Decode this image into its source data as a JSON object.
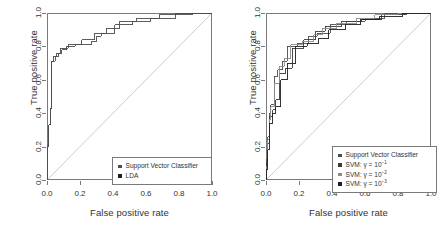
{
  "figure": {
    "background": "#ffffff",
    "axis_color": "#7a7a7a",
    "text_color": "#333333",
    "diagonal_color": "#cccccc"
  },
  "axes": {
    "xlabel": "False positive rate",
    "ylabel": "True positive rate",
    "xticks": [
      "0.0",
      "0.2",
      "0.4",
      "0.6",
      "0.8",
      "1.0"
    ],
    "yticks": [
      "0.0",
      "0.2",
      "0.4",
      "0.6",
      "0.8",
      "1.0"
    ],
    "xlim": [
      0,
      1
    ],
    "ylim": [
      0,
      1
    ]
  },
  "chart_data": [
    {
      "type": "line",
      "panel": "left",
      "title": "",
      "xlabel": "False positive rate",
      "ylabel": "True positive rate",
      "xlim": [
        0,
        1
      ],
      "ylim": [
        0,
        1
      ],
      "grid": false,
      "legend_position": "bottom-right",
      "reference_line": {
        "name": "chance-diagonal",
        "from": [
          0,
          0
        ],
        "to": [
          1,
          1
        ],
        "color": "#cccccc"
      },
      "series": [
        {
          "name": "Support Vector Classifier",
          "color": "#4d4d4d",
          "marker": "square",
          "points": [
            [
              0.0,
              0.0
            ],
            [
              0.0,
              0.2
            ],
            [
              0.01,
              0.2
            ],
            [
              0.01,
              0.33
            ],
            [
              0.02,
              0.33
            ],
            [
              0.02,
              0.43
            ],
            [
              0.03,
              0.43
            ],
            [
              0.03,
              0.71
            ],
            [
              0.05,
              0.71
            ],
            [
              0.05,
              0.74
            ],
            [
              0.07,
              0.74
            ],
            [
              0.07,
              0.76
            ],
            [
              0.09,
              0.76
            ],
            [
              0.09,
              0.78
            ],
            [
              0.12,
              0.78
            ],
            [
              0.12,
              0.8
            ],
            [
              0.17,
              0.8
            ],
            [
              0.17,
              0.81
            ],
            [
              0.27,
              0.81
            ],
            [
              0.27,
              0.83
            ],
            [
              0.3,
              0.83
            ],
            [
              0.3,
              0.86
            ],
            [
              0.33,
              0.86
            ],
            [
              0.33,
              0.88
            ],
            [
              0.41,
              0.88
            ],
            [
              0.41,
              0.93
            ],
            [
              0.52,
              0.93
            ],
            [
              0.52,
              0.95
            ],
            [
              0.63,
              0.95
            ],
            [
              0.63,
              0.97
            ],
            [
              0.78,
              0.97
            ],
            [
              0.78,
              1.0
            ],
            [
              1.0,
              1.0
            ]
          ]
        },
        {
          "name": "LDA",
          "color": "#4d4d4d",
          "marker": "square",
          "points": [
            [
              0.0,
              0.0
            ],
            [
              0.0,
              0.2
            ],
            [
              0.01,
              0.2
            ],
            [
              0.01,
              0.33
            ],
            [
              0.02,
              0.33
            ],
            [
              0.02,
              0.43
            ],
            [
              0.03,
              0.43
            ],
            [
              0.03,
              0.71
            ],
            [
              0.04,
              0.71
            ],
            [
              0.04,
              0.74
            ],
            [
              0.06,
              0.74
            ],
            [
              0.06,
              0.76
            ],
            [
              0.08,
              0.76
            ],
            [
              0.08,
              0.79
            ],
            [
              0.13,
              0.79
            ],
            [
              0.13,
              0.81
            ],
            [
              0.21,
              0.81
            ],
            [
              0.21,
              0.84
            ],
            [
              0.29,
              0.84
            ],
            [
              0.29,
              0.88
            ],
            [
              0.36,
              0.88
            ],
            [
              0.36,
              0.91
            ],
            [
              0.44,
              0.91
            ],
            [
              0.44,
              0.95
            ],
            [
              0.54,
              0.95
            ],
            [
              0.54,
              0.97
            ],
            [
              0.68,
              0.97
            ],
            [
              0.68,
              0.99
            ],
            [
              0.88,
              0.99
            ],
            [
              0.88,
              1.0
            ],
            [
              1.0,
              1.0
            ]
          ]
        }
      ]
    },
    {
      "type": "line",
      "panel": "right",
      "title": "",
      "xlabel": "False positive rate",
      "ylabel": "True positive rate",
      "xlim": [
        0,
        1
      ],
      "ylim": [
        0,
        1
      ],
      "grid": false,
      "legend_position": "bottom-right",
      "reference_line": {
        "name": "chance-diagonal",
        "from": [
          0,
          0
        ],
        "to": [
          1,
          1
        ],
        "color": "#cccccc"
      },
      "series": [
        {
          "name": "Support Vector Classifier",
          "color": "#4d4d4d",
          "marker": "square",
          "points": [
            [
              0.0,
              0.0
            ],
            [
              0.0,
              0.12
            ],
            [
              0.01,
              0.12
            ],
            [
              0.01,
              0.26
            ],
            [
              0.02,
              0.26
            ],
            [
              0.02,
              0.4
            ],
            [
              0.03,
              0.4
            ],
            [
              0.03,
              0.45
            ],
            [
              0.05,
              0.45
            ],
            [
              0.05,
              0.62
            ],
            [
              0.07,
              0.62
            ],
            [
              0.07,
              0.66
            ],
            [
              0.1,
              0.66
            ],
            [
              0.1,
              0.71
            ],
            [
              0.13,
              0.71
            ],
            [
              0.13,
              0.8
            ],
            [
              0.19,
              0.8
            ],
            [
              0.19,
              0.82
            ],
            [
              0.26,
              0.82
            ],
            [
              0.26,
              0.86
            ],
            [
              0.31,
              0.86
            ],
            [
              0.31,
              0.88
            ],
            [
              0.39,
              0.88
            ],
            [
              0.39,
              0.93
            ],
            [
              0.49,
              0.93
            ],
            [
              0.49,
              0.95
            ],
            [
              0.6,
              0.95
            ],
            [
              0.6,
              0.97
            ],
            [
              0.72,
              0.97
            ],
            [
              0.72,
              1.0
            ],
            [
              1.0,
              1.0
            ]
          ]
        },
        {
          "name": "SVM: γ = 10^-1",
          "label_base": "SVM: γ = 10",
          "exponent": "−1",
          "color": "#3a3a3a",
          "marker": "square",
          "points": [
            [
              0.0,
              0.0
            ],
            [
              0.0,
              0.1
            ],
            [
              0.01,
              0.1
            ],
            [
              0.01,
              0.22
            ],
            [
              0.02,
              0.22
            ],
            [
              0.02,
              0.38
            ],
            [
              0.04,
              0.38
            ],
            [
              0.04,
              0.42
            ],
            [
              0.06,
              0.42
            ],
            [
              0.06,
              0.48
            ],
            [
              0.08,
              0.48
            ],
            [
              0.08,
              0.64
            ],
            [
              0.12,
              0.64
            ],
            [
              0.12,
              0.67
            ],
            [
              0.16,
              0.67
            ],
            [
              0.16,
              0.79
            ],
            [
              0.23,
              0.79
            ],
            [
              0.23,
              0.84
            ],
            [
              0.3,
              0.84
            ],
            [
              0.3,
              0.89
            ],
            [
              0.36,
              0.89
            ],
            [
              0.36,
              0.92
            ],
            [
              0.46,
              0.92
            ],
            [
              0.46,
              0.95
            ],
            [
              0.58,
              0.95
            ],
            [
              0.58,
              0.96
            ],
            [
              0.7,
              0.96
            ],
            [
              0.7,
              0.99
            ],
            [
              0.85,
              0.99
            ],
            [
              0.85,
              1.0
            ],
            [
              1.0,
              1.0
            ]
          ]
        },
        {
          "name": "SVM: γ = 10^-2",
          "label_base": "SVM: γ = 10",
          "exponent": "−2",
          "color": "#8c8c8c",
          "marker": "square",
          "points": [
            [
              0.0,
              0.0
            ],
            [
              0.0,
              0.08
            ],
            [
              0.01,
              0.08
            ],
            [
              0.01,
              0.24
            ],
            [
              0.02,
              0.24
            ],
            [
              0.02,
              0.36
            ],
            [
              0.03,
              0.36
            ],
            [
              0.03,
              0.44
            ],
            [
              0.05,
              0.44
            ],
            [
              0.05,
              0.58
            ],
            [
              0.08,
              0.58
            ],
            [
              0.08,
              0.68
            ],
            [
              0.11,
              0.68
            ],
            [
              0.11,
              0.73
            ],
            [
              0.15,
              0.73
            ],
            [
              0.15,
              0.81
            ],
            [
              0.22,
              0.81
            ],
            [
              0.22,
              0.83
            ],
            [
              0.29,
              0.83
            ],
            [
              0.29,
              0.87
            ],
            [
              0.34,
              0.87
            ],
            [
              0.34,
              0.91
            ],
            [
              0.43,
              0.91
            ],
            [
              0.43,
              0.94
            ],
            [
              0.55,
              0.94
            ],
            [
              0.55,
              0.97
            ],
            [
              0.66,
              0.97
            ],
            [
              0.66,
              0.99
            ],
            [
              0.8,
              0.99
            ],
            [
              0.8,
              1.0
            ],
            [
              1.0,
              1.0
            ]
          ]
        },
        {
          "name": "SVM: γ = 10^-3",
          "label_base": "SVM: γ = 10",
          "exponent": "−3",
          "color": "#1f1f1f",
          "marker": "square",
          "points": [
            [
              0.0,
              0.0
            ],
            [
              0.0,
              0.06
            ],
            [
              0.01,
              0.06
            ],
            [
              0.01,
              0.18
            ],
            [
              0.02,
              0.18
            ],
            [
              0.02,
              0.34
            ],
            [
              0.04,
              0.34
            ],
            [
              0.04,
              0.4
            ],
            [
              0.06,
              0.4
            ],
            [
              0.06,
              0.44
            ],
            [
              0.09,
              0.44
            ],
            [
              0.09,
              0.6
            ],
            [
              0.13,
              0.6
            ],
            [
              0.13,
              0.7
            ],
            [
              0.18,
              0.7
            ],
            [
              0.18,
              0.8
            ],
            [
              0.25,
              0.8
            ],
            [
              0.25,
              0.82
            ],
            [
              0.32,
              0.82
            ],
            [
              0.32,
              0.85
            ],
            [
              0.38,
              0.85
            ],
            [
              0.38,
              0.9
            ],
            [
              0.48,
              0.9
            ],
            [
              0.48,
              0.93
            ],
            [
              0.57,
              0.93
            ],
            [
              0.57,
              0.96
            ],
            [
              0.69,
              0.96
            ],
            [
              0.69,
              0.98
            ],
            [
              0.83,
              0.98
            ],
            [
              0.83,
              1.0
            ],
            [
              1.0,
              1.0
            ]
          ]
        }
      ]
    }
  ],
  "legends": {
    "left": {
      "entries": [
        {
          "label": "Support Vector Classifier",
          "color": "#4d4d4d",
          "marker": "square"
        },
        {
          "label": "LDA",
          "color": "#1f1f1f",
          "marker": "square"
        }
      ]
    },
    "right": {
      "entries": [
        {
          "label": "Support Vector Classifier",
          "color": "#4d4d4d",
          "marker": "square",
          "base": "Support Vector Classifier",
          "exp": ""
        },
        {
          "label": "SVM: γ = 10⁻¹",
          "color": "#3a3a3a",
          "marker": "square",
          "base": "SVM: γ = 10",
          "exp": "−1"
        },
        {
          "label": "SVM: γ = 10⁻²",
          "color": "#8c8c8c",
          "marker": "square",
          "base": "SVM: γ = 10",
          "exp": "−2"
        },
        {
          "label": "SVM: γ = 10⁻³",
          "color": "#1f1f1f",
          "marker": "square",
          "base": "SVM: γ = 10",
          "exp": "−3"
        }
      ]
    }
  }
}
